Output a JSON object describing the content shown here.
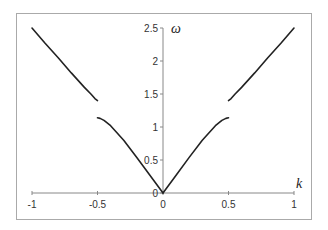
{
  "chart_data": {
    "type": "line",
    "title": "",
    "xlabel": "k",
    "ylabel": "ω",
    "xlim": [
      -1,
      1
    ],
    "ylim": [
      0,
      2.5
    ],
    "grid": false,
    "legend": null,
    "x_ticks": [
      "-1",
      "-0.5",
      "0",
      "0.5",
      "1"
    ],
    "y_ticks": [
      "0",
      "0.5",
      "1",
      "1.5",
      "2",
      "2.5"
    ],
    "series": [
      {
        "name": "lower branch (left)",
        "x": [
          -0.5,
          -0.48,
          -0.45,
          -0.4,
          -0.3,
          -0.2,
          -0.1,
          0
        ],
        "y": [
          1.14,
          1.13,
          1.1,
          1.02,
          0.8,
          0.54,
          0.27,
          0
        ]
      },
      {
        "name": "lower branch (right)",
        "x": [
          0,
          0.1,
          0.2,
          0.3,
          0.4,
          0.45,
          0.48,
          0.5
        ],
        "y": [
          0,
          0.27,
          0.54,
          0.8,
          1.02,
          1.1,
          1.13,
          1.14
        ]
      },
      {
        "name": "upper branch (left)",
        "x": [
          -1,
          -0.9,
          -0.8,
          -0.7,
          -0.6,
          -0.55,
          -0.52,
          -0.5
        ],
        "y": [
          2.5,
          2.27,
          2.05,
          1.82,
          1.6,
          1.5,
          1.43,
          1.4
        ]
      },
      {
        "name": "upper branch (right)",
        "x": [
          0.5,
          0.52,
          0.55,
          0.6,
          0.7,
          0.8,
          0.9,
          1
        ],
        "y": [
          1.4,
          1.43,
          1.5,
          1.6,
          1.82,
          2.05,
          2.27,
          2.5
        ]
      }
    ]
  },
  "colors": {
    "line": "#222222",
    "axis": "#888888",
    "frame": "#aaaaaa"
  }
}
